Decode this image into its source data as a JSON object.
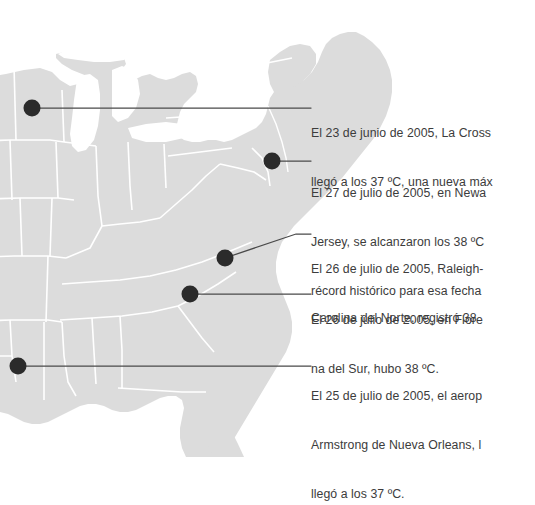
{
  "graphic": {
    "kind": "annotated-map",
    "region": "eastern-united-states",
    "map_fill": "#dcdcdc",
    "map_border": "#ffffff",
    "background": "#ffffff",
    "marker_color": "#2b2b2b",
    "leader_color": "#4a4a4a",
    "text_color": "#3c3c3c"
  },
  "markers": [
    {
      "id": "la-crosse",
      "x": 32,
      "y": 108
    },
    {
      "id": "newark",
      "x": 272,
      "y": 161
    },
    {
      "id": "raleigh-durham",
      "x": 225,
      "y": 258
    },
    {
      "id": "florence",
      "x": 190,
      "y": 294
    },
    {
      "id": "new-orleans",
      "x": 18,
      "y": 366
    }
  ],
  "notes": [
    {
      "id": "note-la-crosse",
      "lines": [
        "El 23 de junio de 2005, La Cross",
        "llegó a los 37 ºC, una nueva máx"
      ]
    },
    {
      "id": "note-newark",
      "lines": [
        "El 27 de julio de 2005, en Newa",
        "Jersey, se alcanzaron los 38 ºC",
        "récord histórico para esa fecha"
      ]
    },
    {
      "id": "note-raleigh",
      "lines": [
        "El 26 de julio de 2005, Raleigh-",
        "Carolina del Norte, registró 38"
      ]
    },
    {
      "id": "note-florence",
      "lines": [
        "El 26 de julio de 2005, en Flore",
        "na del Sur, hubo 38 ºC."
      ]
    },
    {
      "id": "note-new-orleans",
      "lines": [
        "El 25 de julio de 2005, el aerop",
        "Armstrong de Nueva Orleans, l",
        "llegó a los 37 ºC."
      ]
    }
  ]
}
